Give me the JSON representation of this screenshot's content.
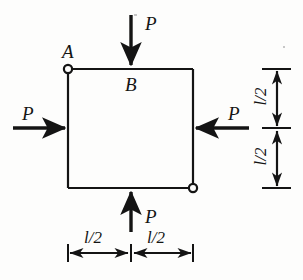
{
  "figure": {
    "type": "engineering-free-body-diagram",
    "colors": {
      "ink": "#141414",
      "paper": "#fdfdfc"
    },
    "nodes": [
      {
        "id": "A",
        "label": "A",
        "position": "top-left",
        "marker": "pin-circle"
      },
      {
        "id": "B",
        "label": "B",
        "position": "top-middle",
        "marker": "none"
      },
      {
        "id": "C",
        "label": "",
        "position": "bottom-right",
        "marker": "pin-circle"
      }
    ],
    "forces": [
      {
        "id": "top",
        "label": "P",
        "direction": "down",
        "applied_at": "top-middle"
      },
      {
        "id": "left",
        "label": "P",
        "direction": "right",
        "applied_at": "left-middle"
      },
      {
        "id": "right",
        "label": "P",
        "direction": "left",
        "applied_at": "right-middle"
      },
      {
        "id": "bottom",
        "label": "P",
        "direction": "up",
        "applied_at": "bottom-middle"
      }
    ],
    "dimensions": [
      {
        "id": "bottom-left-span",
        "label": "l/2",
        "orientation": "horizontal"
      },
      {
        "id": "bottom-right-span",
        "label": "l/2",
        "orientation": "horizontal"
      },
      {
        "id": "right-upper-span",
        "label": "l/2",
        "orientation": "vertical"
      },
      {
        "id": "right-lower-span",
        "label": "l/2",
        "orientation": "vertical"
      }
    ]
  }
}
